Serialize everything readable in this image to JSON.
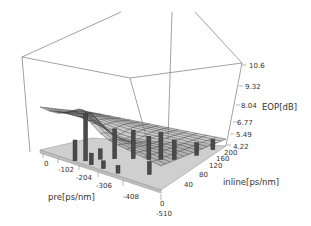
{
  "chart_data": {
    "type": "surface3d",
    "title": "",
    "xlabel": "pre[ps/nm]",
    "ylabel": "inline[ps/nm]",
    "zlabel": "EOP[dB]",
    "x_ticks": [
      "0",
      "-102",
      "-204",
      "-306",
      "-408",
      "-510"
    ],
    "y_ticks": [
      "0",
      "40",
      "80",
      "120",
      "160",
      "200"
    ],
    "z_ticks": [
      "10.6",
      "9.32",
      "8.04",
      "6.77",
      "5.49",
      "4.22"
    ],
    "xlim": [
      -510,
      0
    ],
    "ylim": [
      0,
      200
    ],
    "zlim": [
      4.22,
      10.6
    ],
    "grid": false,
    "legend": "none",
    "surface_peak_approx": {
      "pre": -204,
      "inline": 0,
      "eop": 7.5
    },
    "surface_min_approx": {
      "pre": -510,
      "inline": 200,
      "eop": 4.6
    }
  },
  "axes": {
    "x": {
      "label": "pre[ps/nm]",
      "ticks": [
        "0",
        "-102",
        "-204",
        "-306",
        "-408",
        "-510"
      ]
    },
    "y": {
      "label": "inline[ps/nm]",
      "ticks": [
        "0",
        "40",
        "80",
        "120",
        "160",
        "200"
      ]
    },
    "z": {
      "label": "EOP[dB]",
      "ticks": [
        "10.6",
        "9.32",
        "8.04",
        "6.77",
        "5.49",
        "4.22"
      ]
    }
  }
}
